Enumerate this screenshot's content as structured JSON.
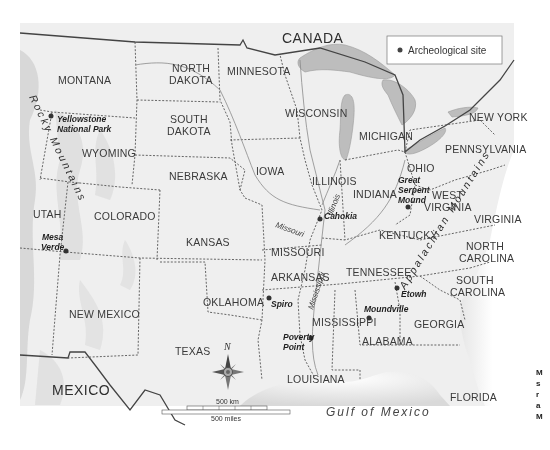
{
  "map": {
    "country_labels": {
      "canada": "CANADA",
      "mexico": "MEXICO"
    },
    "water_labels": {
      "gulf": "Gulf of Mexico"
    },
    "legend": {
      "marker": "●",
      "label": "Archeological site"
    },
    "states": {
      "montana": "MONTANA",
      "north_dakota_1": "NORTH",
      "north_dakota_2": "DAKOTA",
      "minnesota": "MINNESOTA",
      "south_dakota_1": "SOUTH",
      "south_dakota_2": "DAKOTA",
      "wyoming": "WYOMING",
      "nebraska": "NEBRASKA",
      "iowa": "IOWA",
      "wisconsin": "WISCONSIN",
      "michigan": "MICHIGAN",
      "new_york": "NEW YORK",
      "pennsylvania": "PENNSYLVANIA",
      "ohio": "OHIO",
      "illinois": "ILLINOIS",
      "indiana": "INDIANA",
      "west_virginia_1": "WEST",
      "west_virginia_2": "VIRGINIA",
      "virginia": "VIRGINIA",
      "utah": "UTAH",
      "colorado": "COLORADO",
      "kansas": "KANSAS",
      "missouri": "MISSOURI",
      "kentucky": "KENTUCKY",
      "north_carolina_1": "NORTH",
      "north_carolina_2": "CAROLINA",
      "arkansas": "ARKANSAS",
      "tennessee": "TENNESSEE",
      "south_carolina_1": "SOUTH",
      "south_carolina_2": "CAROLINA",
      "oklahoma": "OKLAHOMA",
      "new_mexico": "NEW MEXICO",
      "mississippi": "MISSISSIPPI",
      "georgia": "GEORGIA",
      "alabama": "ALABAMA",
      "texas": "TEXAS",
      "louisiana": "LOUISIANA",
      "florida": "FLORIDA"
    },
    "sites": {
      "yellowstone_1": "Yellowstone",
      "yellowstone_2": "National Park",
      "mesa_verde_1": "Mesa",
      "mesa_verde_2": "Verde",
      "cahokia": "Cahokia",
      "great_serpent_1": "Great",
      "great_serpent_2": "Serpent",
      "great_serpent_3": "Mound",
      "spiro": "Spiro",
      "poverty_point_1": "Poverty",
      "poverty_point_2": "Point",
      "moundville": "Moundville",
      "etowah": "Etowh"
    },
    "rivers": {
      "illinois": "Illinois",
      "missouri": "Missouri",
      "mississippi": "Mississippi"
    },
    "mountains": {
      "rocky": "Rocky Mountains",
      "appalachian": "Appalachian Mountains"
    },
    "compass": {
      "north": "N"
    },
    "scale": {
      "km": "500 km",
      "miles": "500 miles"
    }
  },
  "caption": {
    "lines": [
      "M",
      "s",
      "r",
      "a",
      "M"
    ]
  }
}
